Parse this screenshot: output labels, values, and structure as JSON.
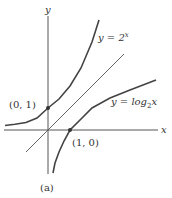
{
  "figure": {
    "caption": "(a)",
    "axes": {
      "x_label": "x",
      "y_label": "y"
    },
    "curves": [
      {
        "name": "exponential",
        "label_prefix": "y = 2",
        "label_sup": "x"
      },
      {
        "name": "logarithm",
        "label_prefix": "y = log",
        "label_sub": "2",
        "label_suffix": "x"
      },
      {
        "name": "identity-line",
        "label": "y = x (unlabeled)"
      }
    ],
    "points": [
      {
        "label": "(0, 1)"
      },
      {
        "label": "(1, 0)"
      }
    ],
    "colors": {
      "curve": "#444444",
      "axis": "#555555",
      "text": "#333333"
    }
  }
}
